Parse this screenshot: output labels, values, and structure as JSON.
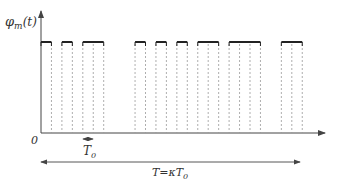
{
  "diagram": {
    "type": "pulse-train",
    "y_label": "φ",
    "y_label_sub": "m",
    "y_label_arg": "(t)",
    "origin_label": "0",
    "unit_label": "T",
    "unit_label_sub": "0",
    "period_label": "T=κT",
    "period_label_sub": "0",
    "unit_px": 10.45,
    "origin_x": 41,
    "pulses_in_slots": [
      {
        "start": 0,
        "length": 1
      },
      {
        "start": 2,
        "length": 1
      },
      {
        "start": 4,
        "length": 2
      },
      {
        "start": 9,
        "length": 1
      },
      {
        "start": 11,
        "length": 1
      },
      {
        "start": 13,
        "length": 1
      },
      {
        "start": 15,
        "length": 2
      },
      {
        "start": 18,
        "length": 3
      },
      {
        "start": 23,
        "length": 2
      }
    ],
    "colors": {
      "axis": "#444444",
      "pulse": "#222222",
      "dashed": "#999999"
    }
  }
}
